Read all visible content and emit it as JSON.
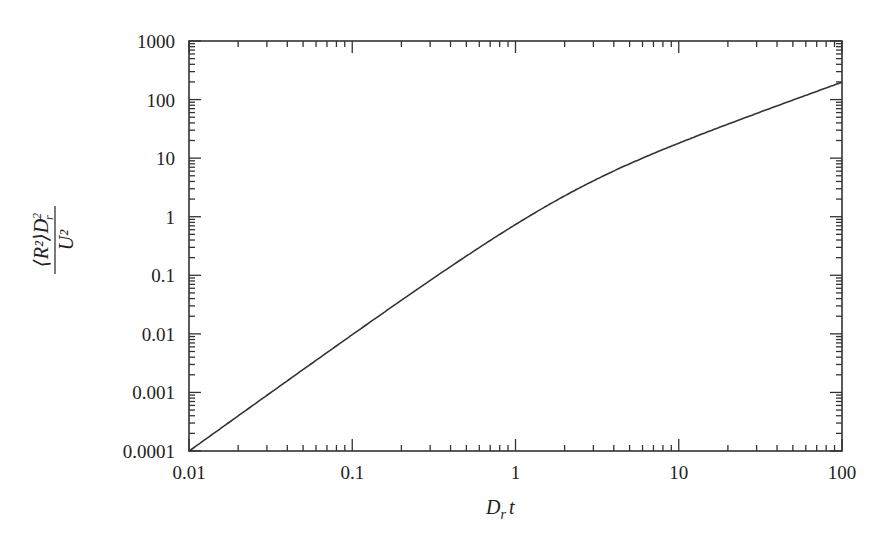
{
  "chart_data": {
    "type": "line",
    "title": "",
    "xlabel": "D_r t",
    "ylabel": "⟨R²⟩D_r² / U²",
    "xscale": "log",
    "yscale": "log",
    "xlim": [
      0.01,
      100
    ],
    "ylim": [
      0.0001,
      1000
    ],
    "grid": false,
    "legend": null,
    "x_ticks": [
      "0.01",
      "0.1",
      "1",
      "10",
      "100"
    ],
    "y_ticks": [
      "0.0001",
      "0.001",
      "0.01",
      "0.1",
      "1",
      "10",
      "100",
      "1000"
    ],
    "series": [
      {
        "name": "mean-square displacement",
        "color": "#333333",
        "x": [
          0.01,
          0.02,
          0.05,
          0.1,
          0.2,
          0.5,
          1,
          2,
          5,
          10,
          20,
          50,
          100
        ],
        "y": [
          0.0001,
          0.000395,
          0.00242,
          0.00967,
          0.0375,
          0.213,
          0.736,
          2.27,
          8.01,
          18.0,
          38.0,
          98.0,
          198.0
        ]
      }
    ]
  },
  "labels": {
    "xlabel_main": "D",
    "xlabel_sub": "r",
    "xlabel_tail": "t",
    "ylabel_num": "⟨R²⟩D",
    "ylabel_num_sup": "2",
    "ylabel_num_sub": "r",
    "ylabel_den": "U²"
  }
}
